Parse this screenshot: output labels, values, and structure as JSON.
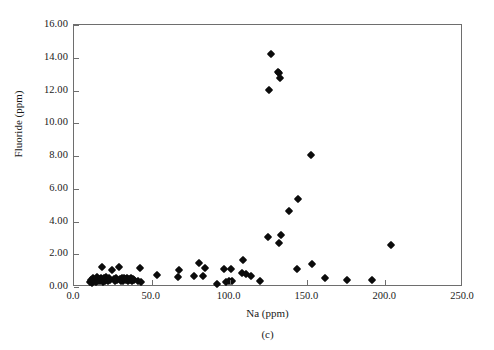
{
  "chart_data": {
    "type": "scatter",
    "title": "",
    "panel_label": "(c)",
    "xlabel": "Na (ppm)",
    "ylabel": "Fluoride (ppm)",
    "xlim": [
      0.0,
      250.0
    ],
    "ylim": [
      0.0,
      16.0
    ],
    "xticks": [
      0.0,
      50.0,
      100.0,
      150.0,
      200.0,
      250.0
    ],
    "yticks": [
      0.0,
      2.0,
      4.0,
      6.0,
      8.0,
      10.0,
      12.0,
      14.0,
      16.0
    ],
    "xtick_labels": [
      "0.0",
      "50.0",
      "100.0",
      "150.0",
      "200.0",
      "250.0"
    ],
    "ytick_labels": [
      "0.00",
      "2.00",
      "4.00",
      "6.00",
      "8.00",
      "10.00",
      "12.00",
      "14.00",
      "16.00"
    ],
    "grid": false,
    "legend": false,
    "marker": "diamond",
    "marker_color": "#0b0b0b",
    "frame_color": "#6e6e6e",
    "series": [
      {
        "name": "Fluoride vs Na",
        "points": [
          [
            10.5,
            0.3
          ],
          [
            11.2,
            0.4
          ],
          [
            11.8,
            0.26
          ],
          [
            12.4,
            0.52
          ],
          [
            13.0,
            0.36
          ],
          [
            13.6,
            0.44
          ],
          [
            14.2,
            0.3
          ],
          [
            14.8,
            0.6
          ],
          [
            15.4,
            0.38
          ],
          [
            16.0,
            0.48
          ],
          [
            16.6,
            0.34
          ],
          [
            17.2,
            0.56
          ],
          [
            17.8,
            0.42
          ],
          [
            18.2,
            1.21
          ],
          [
            18.6,
            0.3
          ],
          [
            19.2,
            0.52
          ],
          [
            19.8,
            0.38
          ],
          [
            20.4,
            0.62
          ],
          [
            21.0,
            0.44
          ],
          [
            21.8,
            0.34
          ],
          [
            22.6,
            0.58
          ],
          [
            23.4,
            0.4
          ],
          [
            24.6,
            1.03
          ],
          [
            25.4,
            0.46
          ],
          [
            26.2,
            0.36
          ],
          [
            27.0,
            0.54
          ],
          [
            27.8,
            0.42
          ],
          [
            28.6,
            1.2
          ],
          [
            29.4,
            0.5
          ],
          [
            30.0,
            0.38
          ],
          [
            30.6,
            0.58
          ],
          [
            31.2,
            0.44
          ],
          [
            31.8,
            0.34
          ],
          [
            32.4,
            0.56
          ],
          [
            33.0,
            0.46
          ],
          [
            33.6,
            0.4
          ],
          [
            34.2,
            0.52
          ],
          [
            34.8,
            0.36
          ],
          [
            35.4,
            0.48
          ],
          [
            36.0,
            0.42
          ],
          [
            36.6,
            0.58
          ],
          [
            37.2,
            0.34
          ],
          [
            37.8,
            0.5
          ],
          [
            38.4,
            0.44
          ],
          [
            41.0,
            0.35
          ],
          [
            42.6,
            1.18
          ],
          [
            43.2,
            0.33
          ],
          [
            53.6,
            0.71
          ],
          [
            66.8,
            0.64
          ],
          [
            67.6,
            1.06
          ],
          [
            77.4,
            0.66
          ],
          [
            80.2,
            1.45
          ],
          [
            82.8,
            0.66
          ],
          [
            84.0,
            1.18
          ],
          [
            92.2,
            0.19
          ],
          [
            96.6,
            1.12
          ],
          [
            97.4,
            0.32
          ],
          [
            99.6,
            0.34
          ],
          [
            100.8,
            1.12
          ],
          [
            101.4,
            0.35
          ],
          [
            108.0,
            0.86
          ],
          [
            108.8,
            1.62
          ],
          [
            110.6,
            0.8
          ],
          [
            114.0,
            0.66
          ],
          [
            119.6,
            0.37
          ],
          [
            124.6,
            3.08
          ],
          [
            125.6,
            12.02
          ],
          [
            126.6,
            14.2
          ],
          [
            131.0,
            13.12
          ],
          [
            132.0,
            13.05
          ],
          [
            132.4,
            12.75
          ],
          [
            131.6,
            2.68
          ],
          [
            133.2,
            3.15
          ],
          [
            138.2,
            4.66
          ],
          [
            143.8,
            5.38
          ],
          [
            143.2,
            1.08
          ],
          [
            152.4,
            8.08
          ],
          [
            153.0,
            1.4
          ],
          [
            161.2,
            0.54
          ],
          [
            175.4,
            0.45
          ],
          [
            191.4,
            0.45
          ],
          [
            203.6,
            2.58
          ]
        ]
      }
    ]
  }
}
